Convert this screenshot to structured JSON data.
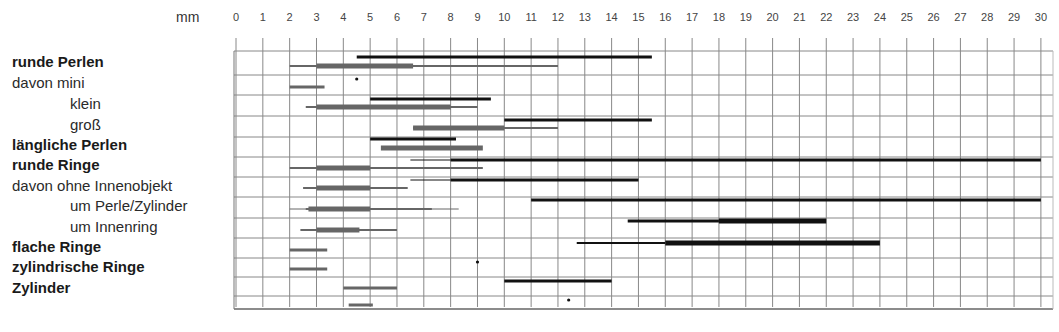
{
  "chart_data": {
    "type": "range-bar",
    "title": "",
    "xlabel": "mm",
    "ylabel": "",
    "xlim": [
      0,
      30
    ],
    "x_ticks": [
      0,
      1,
      2,
      3,
      4,
      5,
      6,
      7,
      8,
      9,
      10,
      11,
      12,
      13,
      14,
      15,
      16,
      17,
      18,
      19,
      20,
      21,
      22,
      23,
      24,
      25,
      26,
      27,
      28,
      29,
      30
    ],
    "grid": true,
    "legend": null,
    "categories": [
      {
        "label": "runde Perlen",
        "style": "bold",
        "indent": false
      },
      {
        "label": "davon mini",
        "style": "normal",
        "indent": false
      },
      {
        "label": "klein",
        "style": "normal",
        "indent": true
      },
      {
        "label": "groß",
        "style": "normal",
        "indent": true
      },
      {
        "label": "längliche Perlen",
        "style": "bold",
        "indent": false
      },
      {
        "label": "runde Ringe",
        "style": "bold",
        "indent": false
      },
      {
        "label": "davon ohne Innenobjekt",
        "style": "normal",
        "indent": false
      },
      {
        "label": "um Perle/Zylinder",
        "style": "normal",
        "indent": true
      },
      {
        "label": "um Innenring",
        "style": "normal",
        "indent": true
      },
      {
        "label": "flache Ringe",
        "style": "bold",
        "indent": false
      },
      {
        "label": "zylindrische Ringe",
        "style": "bold",
        "indent": false
      },
      {
        "label": "Zylinder",
        "style": "bold",
        "indent": false
      },
      {
        "label": "",
        "style": "normal",
        "indent": false
      }
    ],
    "series": [
      {
        "name": "black (upper line)",
        "color": "#111111",
        "rows": [
          {
            "segments": [
              {
                "from": 4.5,
                "to": 15.5,
                "w": 3
              }
            ]
          },
          {
            "points": [
              4.5
            ]
          },
          {
            "segments": [
              {
                "from": 5,
                "to": 9.5,
                "w": 3
              }
            ]
          },
          {
            "segments": [
              {
                "from": 10,
                "to": 15.5,
                "w": 3
              }
            ]
          },
          {
            "segments": [
              {
                "from": 5,
                "to": 8.2,
                "w": 3
              }
            ]
          },
          {
            "segments": [
              {
                "from": 6.5,
                "to": 8,
                "w": 1
              },
              {
                "from": 8,
                "to": 30,
                "w": 3
              }
            ]
          },
          {
            "segments": [
              {
                "from": 6.5,
                "to": 8,
                "w": 1
              },
              {
                "from": 8,
                "to": 15,
                "w": 3
              }
            ]
          },
          {
            "segments": [
              {
                "from": 11,
                "to": 30,
                "w": 3
              }
            ]
          },
          {
            "segments": [
              {
                "from": 14.6,
                "to": 18,
                "w": 3
              },
              {
                "from": 18,
                "to": 22,
                "w": 5
              }
            ]
          },
          {
            "segments": [
              {
                "from": 12.7,
                "to": 16,
                "w": 2
              },
              {
                "from": 16,
                "to": 24,
                "w": 5
              }
            ]
          },
          {
            "points": [
              9
            ]
          },
          {
            "segments": [
              {
                "from": 10,
                "to": 14,
                "w": 3
              }
            ]
          },
          {
            "points": [
              12.4
            ]
          }
        ]
      },
      {
        "name": "grey (lower line)",
        "color": "#666666",
        "rows": [
          {
            "segments": [
              {
                "from": 2,
                "to": 12,
                "w": 2
              },
              {
                "from": 3,
                "to": 6.6,
                "w": 5
              }
            ]
          },
          {
            "segments": [
              {
                "from": 2,
                "to": 3.3,
                "w": 3
              }
            ]
          },
          {
            "segments": [
              {
                "from": 2.6,
                "to": 9,
                "w": 2
              },
              {
                "from": 3,
                "to": 8,
                "w": 5
              }
            ]
          },
          {
            "segments": [
              {
                "from": 6.6,
                "to": 12,
                "w": 2
              },
              {
                "from": 6.6,
                "to": 10,
                "w": 5
              }
            ]
          },
          {
            "segments": [
              {
                "from": 5.4,
                "to": 9.2,
                "w": 5
              }
            ]
          },
          {
            "segments": [
              {
                "from": 2,
                "to": 9.2,
                "w": 2
              },
              {
                "from": 3,
                "to": 5,
                "w": 5
              }
            ]
          },
          {
            "segments": [
              {
                "from": 2.5,
                "to": 6.4,
                "w": 2
              },
              {
                "from": 3,
                "to": 5,
                "w": 5
              }
            ]
          },
          {
            "segments": [
              {
                "from": 2,
                "to": 8.3,
                "w": 1
              },
              {
                "from": 2.6,
                "to": 7.3,
                "w": 2
              },
              {
                "from": 2.7,
                "to": 5,
                "w": 5
              }
            ]
          },
          {
            "segments": [
              {
                "from": 2.4,
                "to": 6,
                "w": 2
              },
              {
                "from": 3,
                "to": 4.6,
                "w": 5
              }
            ]
          },
          {
            "segments": [
              {
                "from": 2,
                "to": 3.4,
                "w": 3
              }
            ]
          },
          {
            "segments": [
              {
                "from": 2,
                "to": 3.4,
                "w": 3
              }
            ]
          },
          {
            "segments": [
              {
                "from": 4,
                "to": 6,
                "w": 3
              }
            ]
          },
          {
            "segments": [
              {
                "from": 4.2,
                "to": 5.1,
                "w": 3
              }
            ]
          }
        ]
      }
    ]
  },
  "header": {
    "unit_label": "mm"
  },
  "layout": {
    "x0_px": 236,
    "px_per_mm": 26.83,
    "top_px": 51,
    "bottom_px": 309,
    "right_px": 1053,
    "tick_top_px": 38,
    "row_lines_px": [
      51,
      75,
      95,
      116,
      137,
      157,
      177,
      197,
      218,
      238,
      258,
      277,
      296,
      309
    ],
    "row_label_y_px": [
      62,
      83,
      104,
      125,
      145,
      165,
      186,
      206,
      227,
      247,
      267,
      288
    ],
    "upper_offset_px": [
      6,
      4,
      4,
      4,
      2,
      3,
      3,
      3,
      3,
      5,
      4,
      4,
      4
    ],
    "lower_offset_px": [
      15,
      12,
      12,
      12,
      11,
      11,
      11,
      12,
      12,
      12,
      11,
      11,
      9
    ]
  }
}
